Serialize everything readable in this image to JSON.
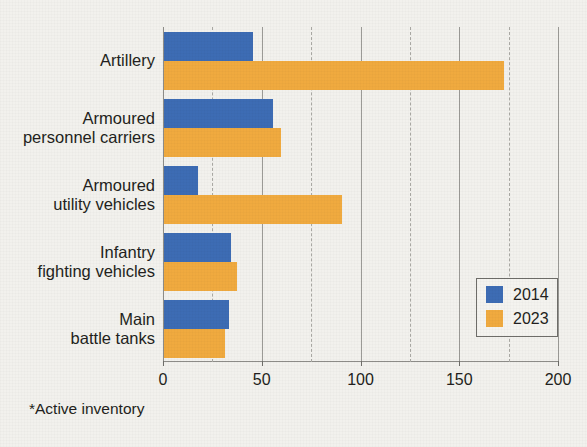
{
  "chart_data": {
    "type": "bar",
    "orientation": "horizontal",
    "title": "2014 and 2023",
    "subtitle": "",
    "xlabel": "",
    "ylabel": "",
    "categories": [
      "Artillery",
      "Armoured\npersonnel carriers",
      "Armoured\nutility vehicles",
      "Infantry\nfighting vehicles",
      "Main\nbattle tanks"
    ],
    "series": [
      {
        "name": "2014",
        "color": "#3d6cb4",
        "values": [
          45,
          55,
          17,
          34,
          33
        ]
      },
      {
        "name": "2023",
        "color": "#f0aa3f",
        "values": [
          172,
          59,
          90,
          37,
          31
        ]
      }
    ],
    "xlim": [
      0,
      200
    ],
    "xticks": [
      0,
      50,
      100,
      150,
      200
    ],
    "xtick_labels": [
      "0",
      "50",
      "100",
      "150",
      "200"
    ],
    "grid": true,
    "legend_position": "bottom-right",
    "footnote": "*Active inventory"
  },
  "legend": {
    "entries": [
      {
        "label": "2014",
        "color": "#3d6cb4"
      },
      {
        "label": "2023",
        "color": "#f0aa3f"
      }
    ]
  },
  "colors": {
    "series_2014": "#3d6cb4",
    "series_2023": "#f0aa3f",
    "background": "#f2f1ed",
    "axis": "#8d8c88",
    "text": "#231f20"
  }
}
